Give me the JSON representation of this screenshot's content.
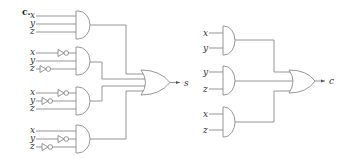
{
  "figure": {
    "part_label": "c.",
    "colors": {
      "line": "#8a8a8a",
      "text": "#333333",
      "background": "#ffffff"
    }
  },
  "sum_circuit": {
    "output_label": "s",
    "gates": [
      {
        "inputs": [
          {
            "label": "x",
            "inverted": false
          },
          {
            "label": "y",
            "inverted": false
          },
          {
            "label": "z",
            "inverted": false
          }
        ]
      },
      {
        "inputs": [
          {
            "label": "x",
            "inverted": true
          },
          {
            "label": "y",
            "inverted": false
          },
          {
            "label": "z",
            "inverted": true
          }
        ]
      },
      {
        "inputs": [
          {
            "label": "x",
            "inverted": true
          },
          {
            "label": "y",
            "inverted": true
          },
          {
            "label": "z",
            "inverted": false
          }
        ]
      },
      {
        "inputs": [
          {
            "label": "x",
            "inverted": false
          },
          {
            "label": "y",
            "inverted": true
          },
          {
            "label": "z",
            "inverted": true
          }
        ]
      }
    ],
    "combiner": "OR"
  },
  "carry_circuit": {
    "output_label": "c",
    "gates": [
      {
        "inputs": [
          {
            "label": "x"
          },
          {
            "label": "y"
          }
        ]
      },
      {
        "inputs": [
          {
            "label": "y"
          },
          {
            "label": "z"
          }
        ]
      },
      {
        "inputs": [
          {
            "label": "x"
          },
          {
            "label": "z"
          }
        ]
      }
    ],
    "combiner": "OR"
  }
}
